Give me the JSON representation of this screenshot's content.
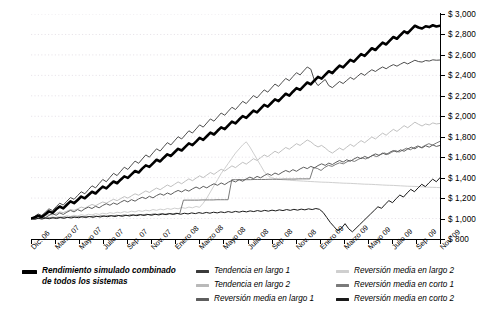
{
  "chart_data": {
    "type": "line",
    "title": "",
    "subtitle": "",
    "xlabel": "",
    "ylabel": "",
    "ylim": [
      800,
      3000
    ],
    "ytick_values": [
      800,
      1000,
      1200,
      1400,
      1600,
      1800,
      2000,
      2200,
      2400,
      2600,
      2800,
      3000
    ],
    "ytick_labels": [
      "$ 800",
      "$ 1,000",
      "$ 1,200",
      "$ 1,400",
      "$ 1,600",
      "$ 1,800",
      "$ 2,000",
      "$ 2,200",
      "$ 2,400",
      "$ 2,600",
      "$ 2,800",
      "$ 3,000"
    ],
    "yaxis_position": "right",
    "xtick_labels": [
      "Dic. 06",
      "Marzo 07",
      "Mayo 07",
      "Julio 07",
      "Sep. 07",
      "Nov. 07",
      "Enero 08",
      "Marzo 08",
      "Mayo 08",
      "Julio 08",
      "Sep. 08",
      "Nov. 08",
      "Enero 09",
      "Marzo 09",
      "Mayo 09",
      "Julio 09",
      "Sep. 09",
      "Nov. 09"
    ],
    "grid": "horizontal-dotted",
    "legend_position": "below",
    "start_value": 1000,
    "series": [
      {
        "name": "Rendimiento simulado combinado de todos los sistemas",
        "color": "#000000",
        "width": 2.6,
        "emphasis": true,
        "values": [
          1000,
          1010,
          1028,
          1015,
          1042,
          1070,
          1055,
          1090,
          1118,
          1100,
          1135,
          1168,
          1150,
          1182,
          1215,
          1198,
          1230,
          1262,
          1245,
          1280,
          1312,
          1295,
          1330,
          1362,
          1345,
          1380,
          1412,
          1398,
          1432,
          1465,
          1450,
          1488,
          1520,
          1505,
          1540,
          1575,
          1558,
          1595,
          1628,
          1612,
          1648,
          1682,
          1665,
          1700,
          1735,
          1718,
          1752,
          1788,
          1770,
          1805,
          1840,
          1822,
          1858,
          1892,
          1875,
          1912,
          1948,
          1930,
          1968,
          2002,
          1985,
          2020,
          2055,
          2038,
          2075,
          2112,
          2095,
          2130,
          2165,
          2148,
          2185,
          2220,
          2202,
          2240,
          2275,
          2258,
          2295,
          2330,
          2312,
          2350,
          2385,
          2368,
          2405,
          2440,
          2422,
          2460,
          2495,
          2478,
          2515,
          2552,
          2535,
          2572,
          2608,
          2590,
          2628,
          2665,
          2648,
          2685,
          2720,
          2702,
          2740,
          2775,
          2758,
          2795,
          2830,
          2812,
          2850,
          2885,
          2868,
          2858,
          2880,
          2872,
          2890,
          2878,
          2885
        ]
      },
      {
        "name": "Tendencia en largo 1",
        "color": "#3a3a3a",
        "width": 0.9,
        "emphasis": false,
        "values": [
          1000,
          1020,
          1045,
          1030,
          1062,
          1095,
          1078,
          1115,
          1150,
          1132,
          1170,
          1205,
          1188,
          1225,
          1262,
          1242,
          1282,
          1320,
          1300,
          1342,
          1382,
          1360,
          1402,
          1442,
          1420,
          1462,
          1502,
          1480,
          1522,
          1562,
          1540,
          1582,
          1622,
          1600,
          1642,
          1682,
          1660,
          1702,
          1742,
          1720,
          1760,
          1800,
          1778,
          1818,
          1858,
          1836,
          1876,
          1916,
          1894,
          1934,
          1974,
          1952,
          1992,
          2032,
          2010,
          2050,
          2088,
          2066,
          2106,
          2146,
          2124,
          2164,
          2202,
          2180,
          2220,
          2258,
          2236,
          2276,
          2315,
          2292,
          2332,
          2370,
          2348,
          2388,
          2426,
          2404,
          2444,
          2482,
          2460,
          2350,
          2300,
          2330,
          2360,
          2300,
          2280,
          2310,
          2340,
          2320,
          2350,
          2380,
          2360,
          2390,
          2420,
          2400,
          2430,
          2455,
          2438,
          2462,
          2482,
          2465,
          2488,
          2505,
          2490,
          2510,
          2528,
          2512,
          2530,
          2548,
          2535,
          2530,
          2545,
          2540,
          2552,
          2548,
          2550
        ]
      },
      {
        "name": "Tendencia en largo 2",
        "color": "#b9b9b9",
        "width": 0.9,
        "emphasis": false,
        "values": [
          1000,
          1008,
          1020,
          1012,
          1028,
          1042,
          1035,
          1050,
          1065,
          1058,
          1072,
          1088,
          1080,
          1095,
          1112,
          1102,
          1120,
          1138,
          1125,
          1145,
          1162,
          1150,
          1170,
          1188,
          1175,
          1195,
          1215,
          1200,
          1222,
          1242,
          1228,
          1250,
          1270,
          1255,
          1278,
          1298,
          1282,
          1305,
          1328,
          1312,
          1335,
          1358,
          1340,
          1365,
          1388,
          1370,
          1395,
          1418,
          1400,
          1425,
          1450,
          1432,
          1458,
          1482,
          1465,
          1490,
          1515,
          1498,
          1525,
          1550,
          1532,
          1558,
          1585,
          1568,
          1595,
          1622,
          1605,
          1632,
          1658,
          1640,
          1668,
          1695,
          1678,
          1705,
          1732,
          1715,
          1742,
          1768,
          1750,
          1720,
          1700,
          1715,
          1690,
          1660,
          1640,
          1665,
          1690,
          1670,
          1698,
          1725,
          1705,
          1735,
          1762,
          1742,
          1770,
          1798,
          1778,
          1808,
          1835,
          1815,
          1845,
          1872,
          1852,
          1880,
          1908,
          1888,
          1915,
          1942,
          1922,
          1905,
          1925,
          1915,
          1935,
          1925,
          1930
        ]
      },
      {
        "name": "Reversión media en largo 1",
        "color": "#5e5e5e",
        "width": 1.0,
        "emphasis": false,
        "values": [
          1000,
          1015,
          1000,
          1022,
          1008,
          1030,
          1048,
          1032,
          1055,
          1040,
          1062,
          1080,
          1065,
          1088,
          1072,
          1095,
          1112,
          1098,
          1120,
          1105,
          1128,
          1145,
          1130,
          1152,
          1138,
          1160,
          1178,
          1162,
          1185,
          1170,
          1192,
          1208,
          1195,
          1218,
          1202,
          1225,
          1242,
          1228,
          1250,
          1235,
          1258,
          1275,
          1260,
          1282,
          1268,
          1290,
          1308,
          1292,
          1315,
          1300,
          1322,
          1340,
          1325,
          1348,
          1332,
          1355,
          1372,
          1358,
          1380,
          1365,
          1388,
          1405,
          1390,
          1412,
          1398,
          1420,
          1438,
          1422,
          1445,
          1430,
          1452,
          1470,
          1455,
          1478,
          1462,
          1485,
          1502,
          1488,
          1510,
          1495,
          1518,
          1535,
          1520,
          1542,
          1528,
          1550,
          1568,
          1552,
          1575,
          1560,
          1582,
          1600,
          1585,
          1608,
          1592,
          1615,
          1632,
          1618,
          1640,
          1625,
          1648,
          1665,
          1650,
          1672,
          1658,
          1680,
          1698,
          1682,
          1705,
          1690,
          1712,
          1698,
          1720,
          1705,
          1715
        ]
      },
      {
        "name": "Reversión media en largo 2",
        "color": "#cfcfcf",
        "width": 1.0,
        "emphasis": false,
        "values": [
          1000,
          995,
          1008,
          1000,
          1012,
          1005,
          1018,
          1010,
          1022,
          1015,
          1028,
          1020,
          1032,
          1025,
          1038,
          1030,
          1042,
          1035,
          1048,
          1040,
          1052,
          1045,
          1058,
          1050,
          1062,
          1055,
          1068,
          1060,
          1072,
          1065,
          1078,
          1070,
          1082,
          1075,
          1088,
          1080,
          1092,
          1085,
          1098,
          1090,
          1102,
          1095,
          1108,
          1100,
          1112,
          1105,
          1118,
          1110,
          1150,
          1200,
          1260,
          1320,
          1380,
          1440,
          1490,
          1540,
          1590,
          1640,
          1680,
          1720,
          1750,
          1700,
          1640,
          1580,
          1520,
          1460,
          1420,
          1400,
          1390,
          1385,
          1380,
          1378,
          1375,
          1372,
          1370,
          1368,
          1366,
          1364,
          1362,
          1360,
          1358,
          1356,
          1355,
          1354,
          1352,
          1350,
          1348,
          1346,
          1345,
          1344,
          1342,
          1340,
          1338,
          1336,
          1335,
          1334,
          1332,
          1330,
          1328,
          1326,
          1325,
          1324,
          1322,
          1320,
          1318,
          1316,
          1315,
          1314,
          1312,
          1310,
          1308,
          1306,
          1305,
          1304,
          1302
        ]
      },
      {
        "name": "Reversión media en corto 1",
        "color": "#7a7a7a",
        "width": 1.0,
        "emphasis": false,
        "values": [
          1000,
          1005,
          1000,
          1008,
          1002,
          1010,
          1005,
          1012,
          1008,
          1015,
          1010,
          1018,
          1012,
          1020,
          1015,
          1022,
          1018,
          1025,
          1020,
          1028,
          1022,
          1030,
          1025,
          1032,
          1028,
          1035,
          1030,
          1038,
          1032,
          1040,
          1035,
          1042,
          1038,
          1045,
          1040,
          1048,
          1042,
          1050,
          1045,
          1052,
          1048,
          1180,
          1180,
          1180,
          1180,
          1180,
          1182,
          1182,
          1182,
          1182,
          1184,
          1184,
          1184,
          1184,
          1380,
          1380,
          1380,
          1380,
          1380,
          1380,
          1382,
          1382,
          1382,
          1382,
          1384,
          1384,
          1384,
          1384,
          1386,
          1386,
          1386,
          1386,
          1388,
          1388,
          1388,
          1388,
          1500,
          1490,
          1470,
          1500,
          1520,
          1510,
          1530,
          1545,
          1535,
          1555,
          1570,
          1558,
          1578,
          1595,
          1582,
          1600,
          1618,
          1605,
          1625,
          1642,
          1628,
          1648,
          1665,
          1650,
          1670,
          1688,
          1672,
          1692,
          1710,
          1695,
          1715,
          1732,
          1718,
          1738,
          1755
        ]
      },
      {
        "name": "Reversión media en corto 2",
        "color": "#1a1a1a",
        "width": 1.0,
        "emphasis": false,
        "values": [
          1000,
          992,
          1002,
          995,
          1005,
          998,
          1008,
          1000,
          1010,
          1002,
          1012,
          1005,
          1015,
          1008,
          1018,
          1010,
          1020,
          1012,
          1022,
          1015,
          1025,
          1018,
          1028,
          1020,
          1030,
          1022,
          1032,
          1025,
          1035,
          1028,
          1038,
          1030,
          1040,
          1032,
          1042,
          1035,
          1045,
          1038,
          1048,
          1040,
          1050,
          1042,
          1052,
          1045,
          1055,
          1048,
          1058,
          1050,
          1060,
          1052,
          1062,
          1055,
          1065,
          1058,
          1068,
          1060,
          1070,
          1062,
          1072,
          1065,
          1075,
          1068,
          1078,
          1070,
          1080,
          1072,
          1082,
          1075,
          1085,
          1078,
          1088,
          1080,
          1090,
          1082,
          1092,
          1085,
          1095,
          1088,
          1098,
          1090,
          1060,
          1010,
          960,
          920,
          880,
          905,
          950,
          900,
          870,
          905,
          940,
          975,
          1010,
          1045,
          1080,
          1115,
          1100,
          1140,
          1175,
          1155,
          1195,
          1230,
          1210,
          1250,
          1285,
          1262,
          1300,
          1335,
          1312,
          1350,
          1385,
          1360,
          1400
        ]
      }
    ]
  },
  "legend": {
    "columns": [
      {
        "items": [
          {
            "label": "Rendimiento simulado combinado\nde todos los sistemas",
            "color": "#000000",
            "thickness": 4,
            "width": 15,
            "primary": true,
            "series_index": 0
          }
        ]
      },
      {
        "items": [
          {
            "label": "Tendencia en largo 1",
            "color": "#3a3a3a",
            "thickness": 3,
            "width": 13,
            "primary": false,
            "series_index": 1
          },
          {
            "label": "Tendencia en largo 2",
            "color": "#b9b9b9",
            "thickness": 3,
            "width": 13,
            "primary": false,
            "series_index": 2
          },
          {
            "label": "Reversión media en largo 1",
            "color": "#5e5e5e",
            "thickness": 3,
            "width": 13,
            "primary": false,
            "series_index": 3
          }
        ]
      },
      {
        "items": [
          {
            "label": "Reversión media en largo 2",
            "color": "#cfcfcf",
            "thickness": 3,
            "width": 13,
            "primary": false,
            "series_index": 4
          },
          {
            "label": "Reversión media en corto 1",
            "color": "#7a7a7a",
            "thickness": 3,
            "width": 13,
            "primary": false,
            "series_index": 5
          },
          {
            "label": "Reversión media en corto 2",
            "color": "#1a1a1a",
            "thickness": 3,
            "width": 13,
            "primary": false,
            "series_index": 6
          }
        ]
      }
    ]
  },
  "style": {
    "background": "#ffffff",
    "axis_color": "#000000",
    "grid_color": "#e8e4ea",
    "text_color": "#000000"
  }
}
